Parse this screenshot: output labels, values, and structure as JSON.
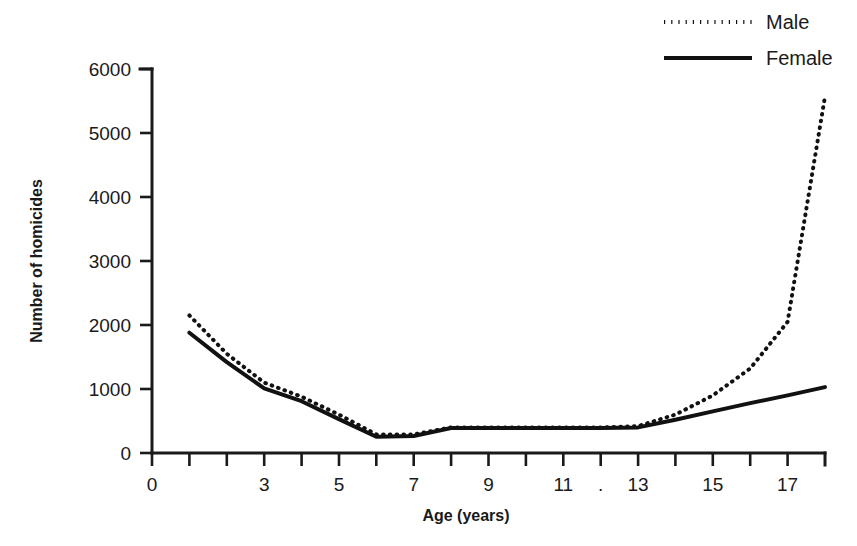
{
  "chart_data": {
    "type": "line",
    "title": "",
    "xlabel": "Age (years)",
    "ylabel": "Number of homicides",
    "xlim": [
      0,
      18
    ],
    "ylim": [
      0,
      6000
    ],
    "grid": false,
    "legend_position": "top-right",
    "y_ticks": [
      0,
      1000,
      2000,
      3000,
      4000,
      5000,
      6000
    ],
    "y_tick_labels": [
      "0",
      "1000",
      "2000",
      "3000",
      "4000",
      "5000",
      "6000"
    ],
    "x_ticks": [
      0,
      1,
      2,
      3,
      4,
      5,
      6,
      7,
      8,
      9,
      10,
      11,
      12,
      13,
      14,
      15,
      16,
      17,
      18
    ],
    "x_tick_labels": [
      "0",
      "",
      "",
      "3",
      "",
      "5",
      "",
      "7",
      "",
      "9",
      "",
      "11",
      ".",
      "13",
      "",
      "15",
      "",
      "17",
      ""
    ],
    "x": [
      1,
      2,
      3,
      4,
      5,
      6,
      7,
      8,
      9,
      10,
      11,
      12,
      13,
      14,
      15,
      16,
      17,
      18
    ],
    "series": [
      {
        "name": "Male",
        "style": "dotted",
        "color": "#111111",
        "values": [
          2150,
          1550,
          1100,
          880,
          600,
          290,
          290,
          400,
          400,
          400,
          400,
          400,
          420,
          600,
          900,
          1320,
          2050,
          5570
        ]
      },
      {
        "name": "Female",
        "style": "solid",
        "color": "#111111",
        "values": [
          1880,
          1420,
          1010,
          810,
          530,
          255,
          265,
          390,
          390,
          390,
          390,
          390,
          400,
          520,
          650,
          780,
          900,
          1030
        ]
      }
    ],
    "annotations": [
      {
        "name": "stray-period-artifact",
        "text": ".",
        "x": 12,
        "position": "x-axis-tick-label"
      }
    ]
  },
  "legend": {
    "entries": [
      {
        "label": "Male",
        "style": "dotted"
      },
      {
        "label": "Female",
        "style": "solid"
      }
    ]
  }
}
